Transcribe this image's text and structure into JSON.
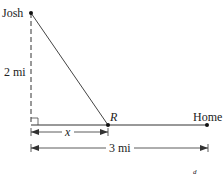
{
  "diagram": {
    "labels": {
      "josh": "Josh",
      "vertical_distance": "2 mi",
      "point_r": "R",
      "home": "Home",
      "segment_x": "x",
      "total_distance": "3 mi",
      "stray_mark": "d"
    },
    "colors": {
      "line": "#333333",
      "text": "#222222",
      "background": "#ffffff"
    }
  }
}
